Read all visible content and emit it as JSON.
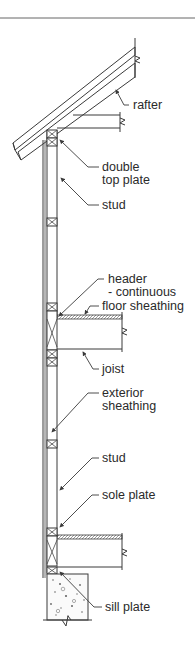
{
  "figure": {
    "type": "wall-section",
    "colors": {
      "line": "#3a3a3a",
      "text": "#2a2a2a",
      "background": "#ffffff"
    }
  },
  "labels": {
    "rafter": "rafter",
    "double_top_plate_1": "double",
    "double_top_plate_2": "top plate",
    "stud_upper": "stud",
    "header_1": "header",
    "header_2": "- continuous",
    "floor_sheathing": "floor sheathing",
    "joist": "joist",
    "exterior_sheathing_1": "exterior",
    "exterior_sheathing_2": "sheathing",
    "stud_lower": "stud",
    "sole_plate": "sole plate",
    "sill_plate": "sill plate"
  }
}
